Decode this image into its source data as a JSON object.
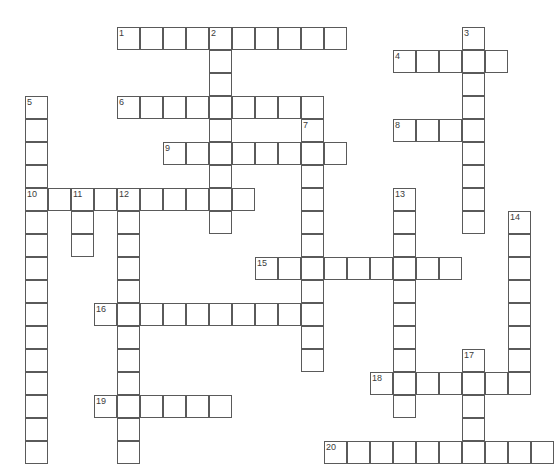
{
  "puzzle": {
    "title": "Crossword Puzzle Grid",
    "cell_size": 23,
    "origin_x": 25,
    "origin_y": 27,
    "grid_cols": 23,
    "grid_rows": 19,
    "colors": {
      "cell_border": "#5a5a5a",
      "cell_fill": "#ffffff",
      "number_text": "#3b3b3b",
      "page_background": "#ffffff"
    },
    "entries": [
      {
        "number": "1",
        "direction": "across",
        "col": 4,
        "row": 0,
        "length": 10
      },
      {
        "number": "2",
        "direction": "down",
        "col": 8,
        "row": 0,
        "length": 9
      },
      {
        "number": "3",
        "direction": "down",
        "col": 19,
        "row": 0,
        "length": 9
      },
      {
        "number": "4",
        "direction": "across",
        "col": 16,
        "row": 1,
        "length": 5
      },
      {
        "number": "5",
        "direction": "down",
        "col": 0,
        "row": 3,
        "length": 16
      },
      {
        "number": "6",
        "direction": "across",
        "col": 4,
        "row": 3,
        "length": 9
      },
      {
        "number": "7",
        "direction": "down",
        "col": 12,
        "row": 4,
        "length": 11
      },
      {
        "number": "8",
        "direction": "across",
        "col": 16,
        "row": 4,
        "length": 4
      },
      {
        "number": "9",
        "direction": "across",
        "col": 6,
        "row": 5,
        "length": 8
      },
      {
        "number": "10",
        "direction": "across",
        "col": 0,
        "row": 7,
        "length": 10
      },
      {
        "number": "11",
        "direction": "down",
        "col": 2,
        "row": 7,
        "length": 3
      },
      {
        "number": "12",
        "direction": "down",
        "col": 4,
        "row": 7,
        "length": 12
      },
      {
        "number": "13",
        "direction": "down",
        "col": 16,
        "row": 7,
        "length": 10
      },
      {
        "number": "14",
        "direction": "down",
        "col": 21,
        "row": 8,
        "length": 8
      },
      {
        "number": "15",
        "direction": "across",
        "col": 10,
        "row": 10,
        "length": 9
      },
      {
        "number": "16",
        "direction": "across",
        "col": 3,
        "row": 12,
        "length": 9
      },
      {
        "number": "17",
        "direction": "down",
        "col": 19,
        "row": 14,
        "length": 5
      },
      {
        "number": "18",
        "direction": "across",
        "col": 15,
        "row": 15,
        "length": 7
      },
      {
        "number": "19",
        "direction": "across",
        "col": 3,
        "row": 16,
        "length": 6
      },
      {
        "number": "20",
        "direction": "across",
        "col": 13,
        "row": 18,
        "length": 10
      }
    ]
  }
}
